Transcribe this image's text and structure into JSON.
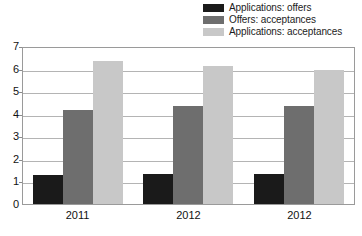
{
  "chart_data": {
    "type": "bar",
    "title": "",
    "xlabel": "",
    "ylabel": "",
    "ylim": [
      0,
      7
    ],
    "yticks": [
      "0",
      "1",
      "2",
      "3",
      "4",
      "5",
      "6",
      "7"
    ],
    "grid": true,
    "legend_position": "top-right",
    "categories": [
      "2011",
      "2012",
      "2012"
    ],
    "series": [
      {
        "name": "Applications: offers",
        "color": "#1a1a1a",
        "values": [
          1.3,
          1.35,
          1.35
        ]
      },
      {
        "name": "Offers: acceptances",
        "color": "#6e6e6e",
        "values": [
          4.2,
          4.4,
          4.4
        ]
      },
      {
        "name": "Applications: acceptances",
        "color": "#c8c8c8",
        "values": [
          6.4,
          6.2,
          6.0
        ]
      }
    ]
  },
  "colors": {
    "dark": "#1a1a1a",
    "medium": "#6e6e6e",
    "light": "#c8c8c8",
    "gridline": "#b4b4b4",
    "frame": "#9a9a9a",
    "text": "#111111"
  }
}
